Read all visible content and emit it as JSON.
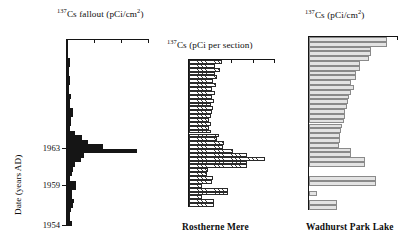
{
  "figure": {
    "yaxis_label": "Date (years AD)",
    "year_ticks": [
      "1963",
      "1959",
      "1954"
    ]
  },
  "panels": [
    {
      "id": "fallout",
      "title_html": "Cs fallout (pCi/cm",
      "title_isotope": "137",
      "title_exponent": "2",
      "title_tail": ")",
      "caption": "",
      "style": "solid"
    },
    {
      "id": "rostherne",
      "title_html": "Cs (pCi per section)",
      "title_isotope": "137",
      "caption": "Rostherne Mere",
      "style": "hatch"
    },
    {
      "id": "wadhurst",
      "title_html": "Cs (pCi/cm",
      "title_isotope": "137",
      "title_exponent": "2",
      "title_tail": ")",
      "caption": "Wadhurst Park Lake",
      "style": "gray"
    }
  ],
  "colors": {
    "solid_fill": "#151515",
    "hatch_line": "#3a3a3a",
    "gray_fill": "#e3e3e3",
    "gray_outline": "#8a8a8a",
    "axis": "#141414"
  },
  "chart_data": {
    "type": "bar",
    "orientation": "horizontal",
    "ylabel": "Date (years AD)",
    "ytick_labels": [
      "1963",
      "1959",
      "1954"
    ],
    "ytick_years": [
      1963,
      1959,
      1954
    ],
    "grid": false,
    "legend": false,
    "panels": [
      {
        "name": "137Cs fallout",
        "xlabel": "137Cs fallout (pCi/cm2)",
        "fill": "solid-black",
        "n_ticks": 3,
        "xlim": [
          0,
          3
        ],
        "values": [
          0.02,
          0.05,
          0.05,
          0.04,
          0.1,
          0.1,
          0.06,
          0.06,
          0.12,
          0.12,
          0.08,
          0.08,
          0.14,
          0.1,
          0.1,
          0.22,
          0.22,
          0.16,
          0.16,
          0.12,
          0.3,
          0.55,
          0.78,
          1.3,
          2.55,
          0.62,
          0.5,
          0.3,
          0.22,
          0.18,
          0.12,
          0.34,
          0.34,
          0.18,
          0.18,
          0.26,
          0.22,
          0.16,
          0.12,
          0.1,
          0.18
        ]
      },
      {
        "name": "Rostherne Mere",
        "xlabel": "137Cs (pCi per section)",
        "fill": "hatched",
        "n_ticks": 4,
        "xlim": [
          0,
          4
        ],
        "values": [
          1.55,
          1.2,
          1.45,
          1.2,
          1.3,
          1.1,
          1.25,
          1.05,
          1.2,
          1.05,
          1.15,
          1.0,
          1.1,
          1.05,
          1.0,
          0.95,
          1.0,
          0.95,
          1.0,
          1.4,
          1.3,
          1.65,
          1.6,
          2.05,
          2.7,
          3.55,
          2.7,
          2.7,
          0.9,
          0.85,
          1.1,
          1.05,
          0.6,
          1.8,
          1.8,
          0.6,
          1.15,
          1.15
        ]
      },
      {
        "name": "Wadhurst Park Lake",
        "xlabel": "137Cs (pCi/cm2)",
        "fill": "light-gray",
        "n_ticks": 2,
        "xlim": [
          0,
          2
        ],
        "values": [
          1.75,
          1.75,
          1.4,
          1.4,
          1.35,
          1.15,
          1.15,
          1.05,
          1.05,
          0.95,
          1.0,
          0.95,
          0.9,
          0.88,
          0.85,
          0.8,
          0.8,
          0.78,
          0.75,
          0.72,
          0.7,
          0.7,
          0.68,
          0.95,
          0.95,
          1.25,
          1.25,
          0.0,
          0.0,
          1.5,
          1.5,
          0.0,
          0.18,
          0.0,
          0.62,
          0.62
        ]
      }
    ]
  }
}
